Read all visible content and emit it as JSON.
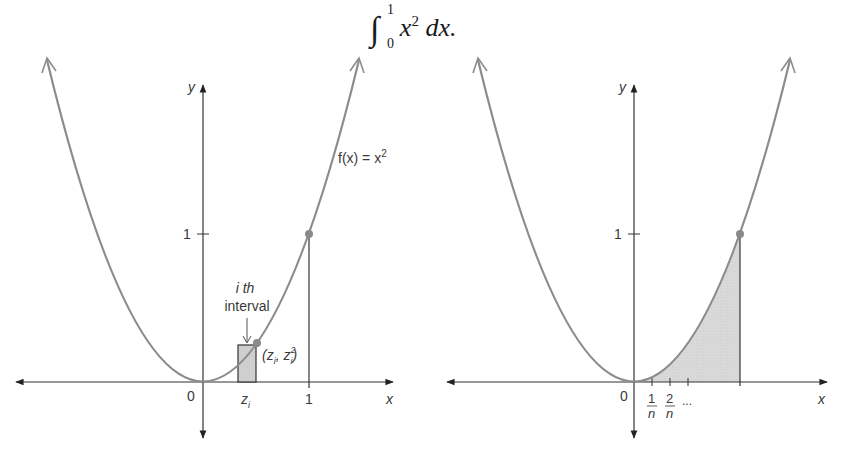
{
  "title": {
    "integral_sign": "∫",
    "upper_limit": "1",
    "lower_limit": "0",
    "integrand_base": "x",
    "integrand_exp": "2",
    "differential": " dx."
  },
  "left_graph": {
    "y_axis_label": "y",
    "x_axis_label": "x",
    "origin_label": "0",
    "y_tick_label": "1",
    "x_tick_label": "1",
    "function_label": "f(x) = x",
    "function_label_exp": "2",
    "ith_label_line1": "i th",
    "ith_label_line2": "interval",
    "zi_label": "z",
    "zi_sub": "i",
    "point_label": "(z",
    "point_label_sub1": "i",
    "point_label_mid": ", z",
    "point_label_sup": "2",
    "point_label_sub2": "i",
    "point_label_end": ")"
  },
  "right_graph": {
    "y_axis_label": "y",
    "x_axis_label": "x",
    "origin_label": "0",
    "y_tick_label": "1",
    "frac1_num": "1",
    "frac1_den": "n",
    "frac2_num": "2",
    "frac2_den": "n",
    "ellipsis": "..."
  },
  "colors": {
    "curve": "#8c8c8c",
    "axis": "#333333",
    "shade": "#d6d6d6",
    "point": "#8a8a8a"
  }
}
